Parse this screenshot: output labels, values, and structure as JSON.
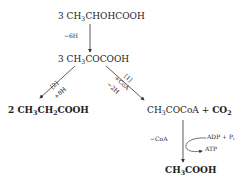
{
  "diagram": {
    "type": "chemical-reaction-scheme",
    "nodes": {
      "lactate": {
        "coef": "3",
        "pre": "CH",
        "sub": "3",
        "post": "CHOHCOOH"
      },
      "pyruvate": {
        "coef": "3",
        "pre": "CH",
        "sub": "3",
        "post": "COCOOH"
      },
      "propionate": {
        "coef": "2",
        "pre": "CH",
        "sub1": "3",
        "mid": "CH",
        "sub2": "2",
        "post": "COOH"
      },
      "acetylcoa": {
        "pre": "CH",
        "sub": "3",
        "post": "COCoA",
        "plus": "+",
        "co2_pre": "CO",
        "co2_sub": "2"
      },
      "acetate": {
        "pre": "CH",
        "sub": "3",
        "post": "COOH"
      }
    },
    "edges": {
      "lactate_to_pyruvate": {
        "label": "−6H"
      },
      "pyruvate_to_propionate": {
        "pathway": "[2]",
        "label": "+8H"
      },
      "pyruvate_to_acetylcoa": {
        "pathway": "[1]",
        "label1": "+CoA",
        "label2": "−2H"
      },
      "acetylcoa_to_acetate": {
        "label": "−CoA",
        "side_in": "ADP + P",
        "side_in_sub": "i",
        "side_out": "ATP"
      }
    }
  }
}
